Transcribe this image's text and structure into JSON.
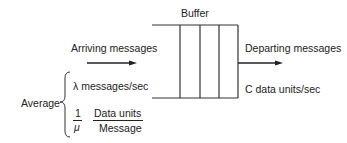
{
  "diagram": {
    "buffer_label": "Buffer",
    "arriving_label": "Arriving messages",
    "departing_label": "Departing messages",
    "departing_rate": "C data units/sec",
    "average_label": "Average",
    "arrival_rate": "λ messages/sec",
    "mean_length": {
      "coef_numerator": "1",
      "coef_denominator": "μ",
      "numerator": "Data units",
      "denominator": "Message"
    },
    "buffer_slots": 4
  }
}
